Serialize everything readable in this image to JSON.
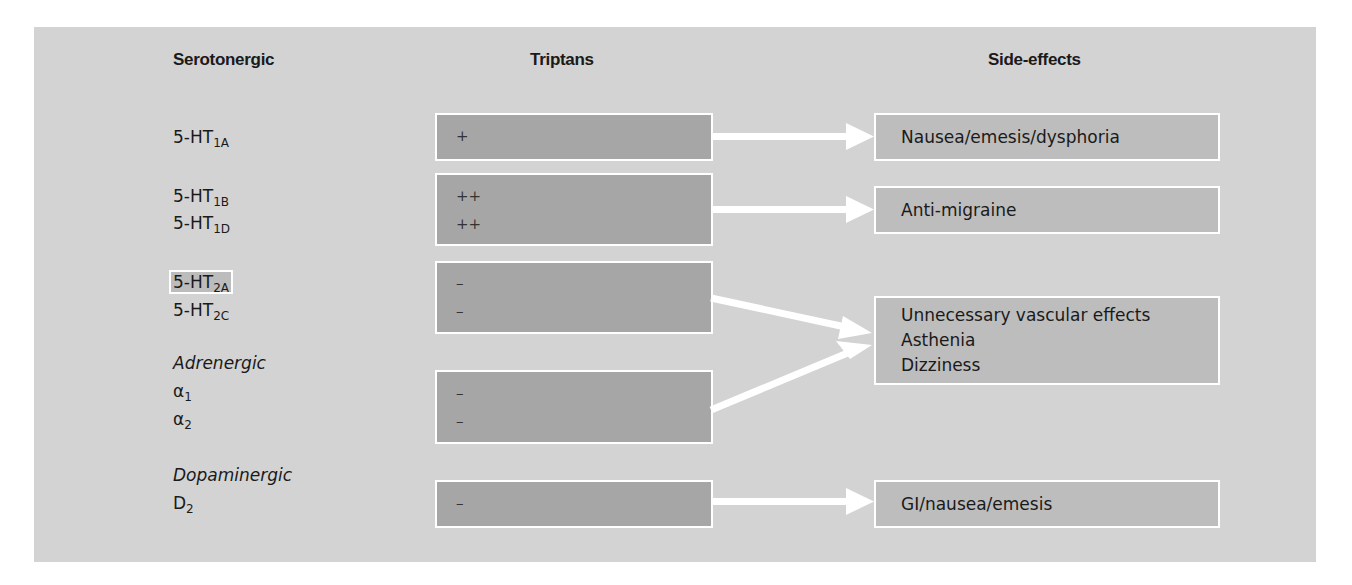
{
  "headers": {
    "receptors": "Serotonergic",
    "triptans": "Triptans",
    "side_effects": "Side-effects"
  },
  "receptors": {
    "ht1a": {
      "base": "5-HT",
      "sub": "1A"
    },
    "ht1b": {
      "base": "5-HT",
      "sub": "1B"
    },
    "ht1d": {
      "base": "5-HT",
      "sub": "1D"
    },
    "ht2a": {
      "base": "5-HT",
      "sub": "2A"
    },
    "ht2c": {
      "base": "5-HT",
      "sub": "2C"
    },
    "adrenergic_label": "Adrenergic",
    "alpha1": {
      "base": "α",
      "sub": "1"
    },
    "alpha2": {
      "base": "α",
      "sub": "2"
    },
    "dopaminergic_label": "Dopaminergic",
    "d2": {
      "base": "D",
      "sub": "2"
    }
  },
  "triptan_boxes": [
    {
      "values": [
        "+"
      ]
    },
    {
      "values": [
        "++",
        "++"
      ]
    },
    {
      "values": [
        "–",
        "–"
      ]
    },
    {
      "values": [
        "–",
        "–"
      ]
    },
    {
      "values": [
        "–"
      ]
    }
  ],
  "side_effect_boxes": [
    {
      "lines": [
        "Nausea/emesis/dysphoria"
      ]
    },
    {
      "lines": [
        "Anti-migraine"
      ]
    },
    {
      "lines": [
        "Unnecessary vascular effects",
        "Asthenia",
        "Dizziness"
      ]
    },
    {
      "lines": [
        "GI/nausea/emesis"
      ]
    }
  ],
  "colors": {
    "panel": "#d3d3d3",
    "triptan_box": "#a6a6a6",
    "side_effect_box": "#bdbdbd",
    "arrow": "#ffffff"
  }
}
